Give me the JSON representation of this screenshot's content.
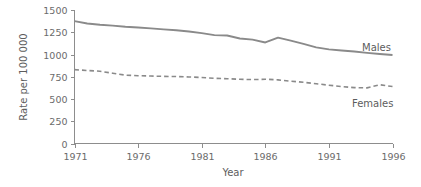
{
  "chart_data": {
    "type": "line",
    "title": "",
    "xlabel": "Year",
    "ylabel": "Rate per 100 000",
    "xlim": [
      1971,
      1996
    ],
    "ylim": [
      0,
      1500
    ],
    "grid": false,
    "legend_position": "inline-right",
    "x_ticks": [
      "1971",
      "1976",
      "1981",
      "1986",
      "1991",
      "1996"
    ],
    "x_tick_values": [
      1971,
      1976,
      1981,
      1986,
      1991,
      1996
    ],
    "y_ticks": [
      "0",
      "250",
      "500",
      "750",
      "1000",
      "1250",
      "1500"
    ],
    "y_tick_values": [
      0,
      250,
      500,
      750,
      1000,
      1250,
      1500
    ],
    "x": [
      1971,
      1972,
      1973,
      1974,
      1975,
      1976,
      1977,
      1978,
      1979,
      1980,
      1981,
      1982,
      1983,
      1984,
      1985,
      1986,
      1987,
      1988,
      1989,
      1990,
      1991,
      1992,
      1993,
      1994,
      1995,
      1996
    ],
    "series": [
      {
        "name": "Males",
        "style": "solid",
        "color": "#8a8a8a",
        "values": [
          1375,
          1348,
          1334,
          1325,
          1312,
          1303,
          1293,
          1282,
          1272,
          1258,
          1240,
          1218,
          1213,
          1180,
          1167,
          1135,
          1190,
          1155,
          1120,
          1080,
          1058,
          1045,
          1033,
          1018,
          1005,
          995
        ]
      },
      {
        "name": "Females",
        "style": "dashed",
        "color": "#8a8a8a",
        "values": [
          830,
          820,
          812,
          790,
          768,
          762,
          758,
          754,
          752,
          748,
          742,
          732,
          728,
          722,
          718,
          722,
          715,
          700,
          688,
          672,
          655,
          640,
          628,
          625,
          660,
          640
        ]
      }
    ],
    "annotations": [
      {
        "text": "Males",
        "series": "Males"
      },
      {
        "text": "Females",
        "series": "Females"
      }
    ]
  },
  "series_labels": {
    "males": "Males",
    "females": "Females"
  },
  "axes": {
    "x_title": "Year",
    "y_title": "Rate per 100 000"
  },
  "colors": {
    "line": "#8a8a8a",
    "axis": "#8d8d8d",
    "text": "#6b6b6b"
  }
}
